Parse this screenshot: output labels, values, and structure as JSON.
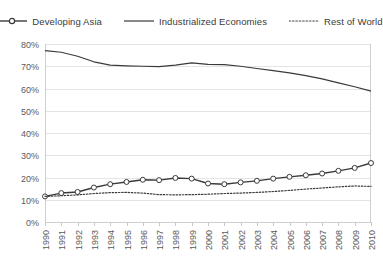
{
  "legend": {
    "position": "top-center",
    "items": [
      {
        "label": "Developing Asia",
        "style": "line-marker",
        "marker": "open-circle",
        "color": "#3a3a3a"
      },
      {
        "label": "Industrialized Economies",
        "style": "solid-line",
        "marker": "none",
        "color": "#3a3a3a"
      },
      {
        "label": "Rest of World",
        "style": "dotted-line",
        "marker": "none",
        "color": "#3a3a3a"
      }
    ]
  },
  "axes": {
    "y_ticks": [
      "0%",
      "10%",
      "20%",
      "30%",
      "40%",
      "50%",
      "60%",
      "70%",
      "80%"
    ],
    "x_ticks": [
      "1990",
      "1991",
      "1992",
      "1993",
      "1994",
      "1995",
      "1996",
      "1997",
      "1998",
      "1999",
      "2000",
      "2001",
      "2002",
      "2003",
      "2004",
      "2005",
      "2006",
      "2007",
      "2008",
      "2009",
      "2010"
    ]
  },
  "chart_data": {
    "type": "line",
    "title": "",
    "subtitle": "",
    "xlabel": "",
    "ylabel": "",
    "ylim": [
      0,
      80
    ],
    "ytick_step": 10,
    "ytick_format": "percent",
    "grid": true,
    "legend_position": "top-center",
    "x": [
      1990,
      1991,
      1992,
      1993,
      1994,
      1995,
      1996,
      1997,
      1998,
      1999,
      2000,
      2001,
      2002,
      2003,
      2004,
      2005,
      2006,
      2007,
      2008,
      2009,
      2010
    ],
    "categories": [
      "1990",
      "1991",
      "1992",
      "1993",
      "1994",
      "1995",
      "1996",
      "1997",
      "1998",
      "1999",
      "2000",
      "2001",
      "2002",
      "2003",
      "2004",
      "2005",
      "2006",
      "2007",
      "2008",
      "2009",
      "2010"
    ],
    "series": [
      {
        "name": "Developing Asia",
        "marker": "open-circle",
        "linestyle": "solid",
        "color": "#3a3a3a",
        "values": [
          11.5,
          13.0,
          13.5,
          15.5,
          17.0,
          18.0,
          19.0,
          18.8,
          19.8,
          19.5,
          17.3,
          17.0,
          17.8,
          18.5,
          19.5,
          20.3,
          21.0,
          21.8,
          23.0,
          24.3,
          26.5
        ]
      },
      {
        "name": "Industrialized Economies",
        "marker": "none",
        "linestyle": "solid",
        "color": "#3a3a3a",
        "values": [
          77.0,
          76.3,
          74.5,
          72.0,
          70.5,
          70.2,
          70.0,
          69.8,
          70.5,
          71.5,
          70.8,
          70.7,
          70.0,
          69.0,
          68.0,
          67.0,
          65.8,
          64.3,
          62.5,
          60.8,
          58.8
        ]
      },
      {
        "name": "Rest of World",
        "marker": "none",
        "linestyle": "dotted",
        "color": "#4a4a4a",
        "values": [
          11.5,
          11.8,
          12.2,
          12.8,
          13.2,
          13.3,
          13.0,
          12.3,
          12.2,
          12.3,
          12.5,
          12.8,
          13.0,
          13.3,
          13.7,
          14.2,
          14.8,
          15.3,
          15.8,
          16.2,
          16.0
        ]
      }
    ]
  }
}
